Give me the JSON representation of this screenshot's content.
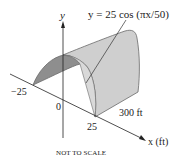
{
  "figure": {
    "equation": "y = 25 cos (πx/50)",
    "axis_y_label": "y",
    "axis_x_label": "x (ft)",
    "tick_labels": {
      "neg": "−25",
      "zero": "0",
      "pos": "25"
    },
    "length_label": "300 ft",
    "note": "NOT TO SCALE",
    "colors": {
      "surface_light": "#cfcfcf",
      "surface_dark": "#8e8e8e",
      "edge": "#6a6a6a",
      "axis": "#222222"
    }
  }
}
